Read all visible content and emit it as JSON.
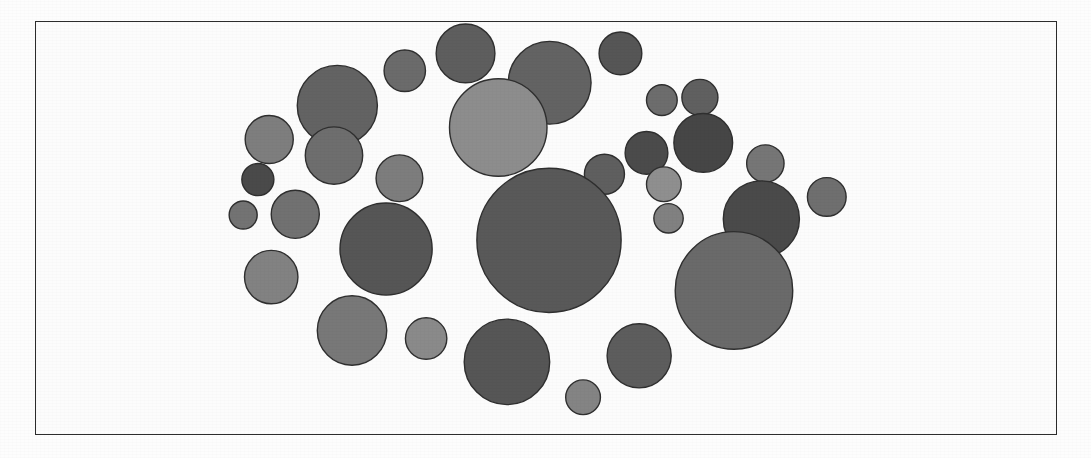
{
  "figure": {
    "kind": "circle-packing-diagram",
    "frame": {
      "x": 35,
      "y": 21,
      "width": 1022,
      "height": 414,
      "border_color": "#2c2c2c",
      "border_width": 1.5
    },
    "background_color": "#fcfcfc",
    "page_color": "#fdfdfd",
    "circle_stroke_color": "#2f2f2f",
    "circle_count": 31
  },
  "chart_data": {
    "type": "scatter",
    "title": "",
    "subtitle": "",
    "xlabel": "",
    "ylabel": "",
    "grid": false,
    "legend": null,
    "axis_visible": false,
    "tick_labels": [],
    "annotations": [],
    "xlim": [
      0,
      1022
    ],
    "ylim": [
      0,
      414
    ],
    "units": "pixels (frame-relative coordinates)",
    "fields": [
      "cx",
      "cy",
      "r",
      "fill"
    ],
    "circles": [
      {
        "id": "c01",
        "cx": 197,
        "cy": 125,
        "r": 60,
        "fill": "#636363"
      },
      {
        "id": "c02",
        "cx": 298,
        "cy": 73,
        "r": 31,
        "fill": "#6b6b6b"
      },
      {
        "id": "c03",
        "cx": 389,
        "cy": 47,
        "r": 44,
        "fill": "#5e5e5e"
      },
      {
        "id": "c04",
        "cx": 515,
        "cy": 91,
        "r": 62,
        "fill": "#636363"
      },
      {
        "id": "c05",
        "cx": 621,
        "cy": 47,
        "r": 32,
        "fill": "#565656"
      },
      {
        "id": "c06",
        "cx": 438,
        "cy": 158,
        "r": 73,
        "fill": "#8d8d8d"
      },
      {
        "id": "c07",
        "cx": 683,
        "cy": 117,
        "r": 23,
        "fill": "#6d6d6d"
      },
      {
        "id": "c08",
        "cx": 740,
        "cy": 113,
        "r": 27,
        "fill": "#606060"
      },
      {
        "id": "c09",
        "cx": 745,
        "cy": 181,
        "r": 44,
        "fill": "#464646"
      },
      {
        "id": "c10",
        "cx": 660,
        "cy": 196,
        "r": 32,
        "fill": "#4b4b4b"
      },
      {
        "id": "c11",
        "cx": 95,
        "cy": 176,
        "r": 36,
        "fill": "#7e7e7e"
      },
      {
        "id": "c12",
        "cx": 192,
        "cy": 200,
        "r": 43,
        "fill": "#6e6e6e"
      },
      {
        "id": "c13",
        "cx": 78,
        "cy": 236,
        "r": 24,
        "fill": "#4a4a4a"
      },
      {
        "id": "c14",
        "cx": 290,
        "cy": 234,
        "r": 35,
        "fill": "#7d7d7d"
      },
      {
        "id": "c15",
        "cx": 597,
        "cy": 228,
        "r": 30,
        "fill": "#5f5f5f"
      },
      {
        "id": "c16",
        "cx": 686,
        "cy": 243,
        "r": 26,
        "fill": "#8f8f8f"
      },
      {
        "id": "c17",
        "cx": 838,
        "cy": 212,
        "r": 28,
        "fill": "#767676"
      },
      {
        "id": "c18",
        "cx": 56,
        "cy": 289,
        "r": 21,
        "fill": "#737373"
      },
      {
        "id": "c19",
        "cx": 134,
        "cy": 288,
        "r": 36,
        "fill": "#717171"
      },
      {
        "id": "c20",
        "cx": 693,
        "cy": 294,
        "r": 22,
        "fill": "#818181"
      },
      {
        "id": "c21",
        "cx": 832,
        "cy": 295,
        "r": 57,
        "fill": "#4a4a4a"
      },
      {
        "id": "c22",
        "cx": 514,
        "cy": 327,
        "r": 108,
        "fill": "#595959"
      },
      {
        "id": "c23",
        "cx": 270,
        "cy": 340,
        "r": 69,
        "fill": "#565656"
      },
      {
        "id": "c24",
        "cx": 98,
        "cy": 382,
        "r": 40,
        "fill": "#828282"
      },
      {
        "id": "c25",
        "cx": 791,
        "cy": 402,
        "r": 88,
        "fill": "#6a6a6a"
      },
      {
        "id": "c26",
        "cx": 219,
        "cy": 462,
        "r": 52,
        "fill": "#787878"
      },
      {
        "id": "c27",
        "cx": 330,
        "cy": 474,
        "r": 31,
        "fill": "#8a8a8a"
      },
      {
        "id": "c28",
        "cx": 451,
        "cy": 509,
        "r": 64,
        "fill": "#565656"
      },
      {
        "id": "c29",
        "cx": 649,
        "cy": 500,
        "r": 48,
        "fill": "#5d5d5d"
      },
      {
        "id": "c30",
        "cx": 565,
        "cy": 562,
        "r": 26,
        "fill": "#848484"
      },
      {
        "id": "c31",
        "cx": 930,
        "cy": 262,
        "r": 29,
        "fill": "#6f6f6f"
      }
    ]
  }
}
